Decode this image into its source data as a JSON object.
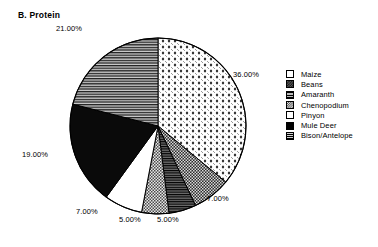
{
  "chart_data": {
    "type": "pie",
    "title": "B.  Protein",
    "xlabel": "",
    "ylabel": "",
    "grid": false,
    "legend_position": "right",
    "start_angle_deg": 0,
    "direction": "clockwise",
    "categories": [
      "Maize",
      "Beans",
      "Amaranth",
      "Chenopodium",
      "Pinyon",
      "Mule Deer",
      "Bison/Antelope"
    ],
    "values": [
      36,
      7,
      5,
      5,
      7,
      19,
      21
    ],
    "data_labels": [
      "36.00%",
      "7.00%",
      "5.00%",
      "5.00%",
      "7.00%",
      "19.00%",
      "21.00%"
    ],
    "patterns": [
      "light-diamond-dots",
      "dark-checker",
      "dark-horizontal-lines",
      "gray-checker",
      "solid-white",
      "solid-black",
      "gray-horizontal-lines"
    ],
    "slices": [
      {
        "label": "Maize",
        "value": 36,
        "data_label": "36.00%",
        "pattern": "light-diamond-dots"
      },
      {
        "label": "Beans",
        "value": 7,
        "data_label": "7.00%",
        "pattern": "dark-checker"
      },
      {
        "label": "Amaranth",
        "value": 5,
        "data_label": "5.00%",
        "pattern": "dark-horizontal-lines"
      },
      {
        "label": "Chenopodium",
        "value": 5,
        "data_label": "5.00%",
        "pattern": "gray-checker"
      },
      {
        "label": "Pinyon",
        "value": 7,
        "data_label": "7.00%",
        "pattern": "solid-white"
      },
      {
        "label": "Mule Deer",
        "value": 19,
        "data_label": "19.00%",
        "pattern": "solid-black"
      },
      {
        "label": "Bison/Antelope",
        "value": 21,
        "data_label": "21.00%",
        "pattern": "gray-horizontal-lines"
      }
    ]
  },
  "title": {
    "text": "B.  Protein"
  },
  "labels": {
    "maize_pct": "36.00%",
    "beans_pct": "7.00%",
    "amaranth_pct": "5.00%",
    "chenopodium_pct": "5.00%",
    "pinyon_pct": "7.00%",
    "muledeer_pct": "19.00%",
    "bison_pct": "21.00%"
  },
  "legend": {
    "items": [
      {
        "label": "Maize"
      },
      {
        "label": "Beans"
      },
      {
        "label": "Amaranth"
      },
      {
        "label": "Chenopodium"
      },
      {
        "label": "Pinyon"
      },
      {
        "label": "Mule Deer"
      },
      {
        "label": "Bison/Antelope"
      }
    ]
  },
  "colors": {
    "outline": "#000000",
    "background": "#ffffff",
    "solid_black": "#000000",
    "solid_white": "#ffffff",
    "gray": "#9a9a9a"
  }
}
